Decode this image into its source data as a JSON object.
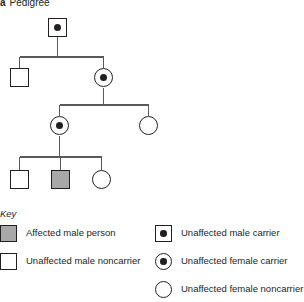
{
  "figure": {
    "label_prefix": "a",
    "title": "Pedigree"
  },
  "colors": {
    "affected_fill": "#a8a8a8",
    "symbol_stroke": "#231f20",
    "connector_line": "#58595b",
    "background": "#ffffff",
    "text": "#231f20"
  },
  "pedigree": {
    "generations": [
      {
        "generation": 1,
        "members": [
          {
            "id": "I-1",
            "symbol": "square",
            "sex": "male",
            "status": "unaffected male carrier",
            "carrier_dot": true,
            "affected": false
          }
        ]
      },
      {
        "generation": 2,
        "members": [
          {
            "id": "II-1",
            "symbol": "square",
            "sex": "male",
            "status": "unaffected male noncarrier",
            "carrier_dot": false,
            "affected": false
          },
          {
            "id": "II-2",
            "symbol": "circle",
            "sex": "female",
            "status": "unaffected female carrier",
            "carrier_dot": true,
            "affected": false
          }
        ]
      },
      {
        "generation": 3,
        "members": [
          {
            "id": "III-1",
            "symbol": "circle",
            "sex": "female",
            "status": "unaffected female carrier",
            "carrier_dot": true,
            "affected": false
          },
          {
            "id": "III-2",
            "symbol": "circle",
            "sex": "female",
            "status": "unaffected female noncarrier",
            "carrier_dot": false,
            "affected": false
          }
        ]
      },
      {
        "generation": 4,
        "members": [
          {
            "id": "IV-1",
            "symbol": "square",
            "sex": "male",
            "status": "unaffected male noncarrier",
            "carrier_dot": false,
            "affected": false
          },
          {
            "id": "IV-2",
            "symbol": "square",
            "sex": "male",
            "status": "affected male person",
            "carrier_dot": false,
            "affected": true
          },
          {
            "id": "IV-3",
            "symbol": "circle",
            "sex": "female",
            "status": "unaffected female noncarrier",
            "carrier_dot": false,
            "affected": false
          }
        ]
      }
    ]
  },
  "legend": {
    "title": "Key",
    "left_column": [
      {
        "symbol": "square-filled",
        "label": "Affected male person"
      },
      {
        "symbol": "square-open",
        "label": "Unaffected male noncarrier"
      }
    ],
    "right_column": [
      {
        "symbol": "square-dot",
        "label": "Unaffected male carrier"
      },
      {
        "symbol": "circle-dot",
        "label": "Unaffected female carrier"
      },
      {
        "symbol": "circle-open",
        "label": "Unaffected female noncarrier"
      }
    ]
  }
}
